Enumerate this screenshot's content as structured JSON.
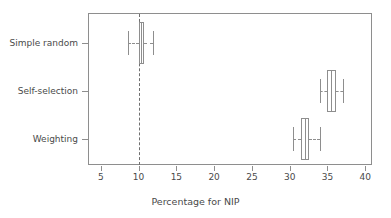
{
  "chart_data": {
    "type": "boxplot",
    "title": "",
    "xlabel": "Percentage for NIP",
    "ylabel": "",
    "xlim": [
      3.3,
      40.9
    ],
    "grid": false,
    "legend": null,
    "orientation": "horizontal",
    "x_ticks": [
      5,
      10,
      15,
      20,
      25,
      30,
      35,
      40
    ],
    "x_tick_labels": [
      "5",
      "10",
      "15",
      "20",
      "25",
      "30",
      "35",
      "40"
    ],
    "categories": [
      "Simple random",
      "Self-selection",
      "Weighting"
    ],
    "reference_line": {
      "value": 10,
      "style": "dashed"
    },
    "boxes": [
      {
        "category": "Simple random",
        "whisker_low": 8.6,
        "q1": 10.0,
        "median": 10.35,
        "q3": 10.75,
        "whisker_high": 11.9
      },
      {
        "category": "Self-selection",
        "whisker_low": 34.0,
        "q1": 34.9,
        "median": 35.5,
        "q3": 36.1,
        "whisker_high": 37.0
      },
      {
        "category": "Weighting",
        "whisker_low": 30.5,
        "q1": 31.5,
        "median": 32.05,
        "q3": 32.6,
        "whisker_high": 34.0
      }
    ]
  },
  "axis": {
    "x_title": "Percentage for NIP",
    "tick_5": "5",
    "tick_10": "10",
    "tick_15": "15",
    "tick_20": "20",
    "tick_25": "25",
    "tick_30": "30",
    "tick_35": "35",
    "tick_40": "40",
    "cat_simple_random": "Simple random",
    "cat_self_selection": "Self-selection",
    "cat_weighting": "Weighting"
  },
  "colors": {
    "frame": "#8e8e8e",
    "line": "#8e8e8e",
    "text": "#4a4a4a",
    "background": "#ffffff"
  }
}
